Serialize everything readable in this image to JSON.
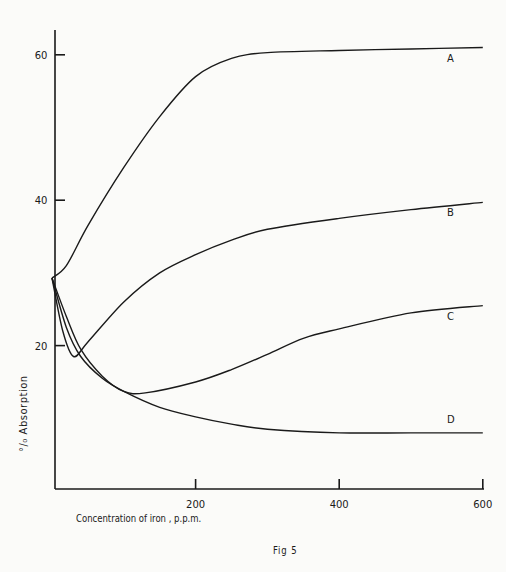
{
  "chart_data": {
    "type": "line",
    "title": "",
    "caption": "Fig 5",
    "xlabel": "Concentration of iron , p.p.m.",
    "ylabel": "°/₀ Absorption",
    "xlim": [
      0,
      600
    ],
    "ylim": [
      0,
      63
    ],
    "x_ticks": [
      200,
      400,
      600
    ],
    "y_ticks": [
      20,
      40,
      60
    ],
    "grid": false,
    "legend": "inline labels at right end of each curve",
    "series": [
      {
        "name": "A",
        "x": [
          0,
          20,
          50,
          100,
          150,
          200,
          250,
          300,
          400,
          500,
          600
        ],
        "values": [
          29.3,
          31,
          36.5,
          44.5,
          51.5,
          57,
          59.5,
          60.3,
          60.6,
          60.8,
          61
        ]
      },
      {
        "name": "B",
        "x": [
          0,
          15,
          30,
          50,
          100,
          150,
          200,
          250,
          300,
          400,
          500,
          600
        ],
        "values": [
          29.3,
          22,
          18.5,
          20.5,
          26,
          30,
          32.5,
          34.5,
          36,
          37.5,
          38.7,
          39.7
        ]
      },
      {
        "name": "C",
        "x": [
          0,
          20,
          40,
          70,
          100,
          130,
          200,
          250,
          300,
          350,
          400,
          500,
          600
        ],
        "values": [
          29.3,
          24,
          19.5,
          15.8,
          13.7,
          13.5,
          15,
          16.7,
          18.8,
          21,
          22.3,
          24.5,
          25.5
        ]
      },
      {
        "name": "D",
        "x": [
          0,
          20,
          40,
          70,
          100,
          150,
          200,
          250,
          300,
          400,
          500,
          600
        ],
        "values": [
          29.3,
          22.5,
          18.5,
          15.5,
          13.7,
          11.5,
          10.2,
          9.2,
          8.5,
          8,
          8,
          8
        ]
      }
    ]
  },
  "axes": {
    "y_tick_labels": [
      "20",
      "40",
      "60"
    ],
    "x_tick_labels": [
      "200",
      "400",
      "600"
    ]
  },
  "labels": {
    "ylabel": "°/₀ Absorption",
    "xlabel": "Concentration of iron , p.p.m.",
    "caption": "Fig 5",
    "series_labels": [
      "A",
      "B",
      "C",
      "D"
    ]
  }
}
